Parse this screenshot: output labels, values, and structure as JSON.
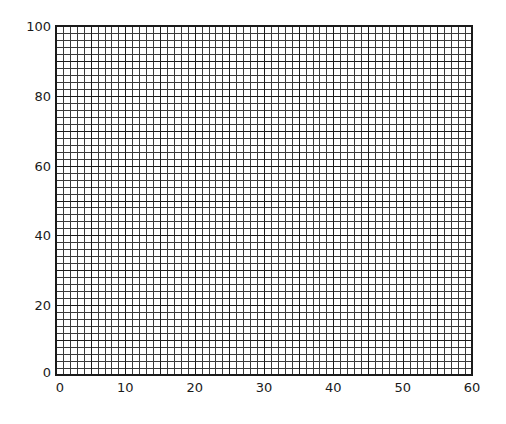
{
  "chart_data": {
    "type": "scatter",
    "title": "",
    "xlabel": "",
    "ylabel": "",
    "xlim": [
      0,
      60
    ],
    "ylim": [
      0,
      100
    ],
    "x_ticks": [
      0,
      10,
      20,
      30,
      40,
      50,
      60
    ],
    "y_ticks": [
      0,
      20,
      40,
      60,
      80,
      100
    ],
    "x_tick_labels": [
      "0",
      "10",
      "20",
      "30",
      "40",
      "50",
      "60"
    ],
    "y_tick_labels": [
      "0",
      "20",
      "40",
      "60",
      "80",
      "100"
    ],
    "grid": {
      "on": true,
      "x_major_step": 5,
      "x_minor_step": 1,
      "y_major_step": 10,
      "y_minor_step": 2
    },
    "series": [],
    "legend": null
  },
  "style": {
    "line_color": "#1a1a1a",
    "minor_line_color": "#3a3a3a",
    "background": "#ffffff"
  }
}
